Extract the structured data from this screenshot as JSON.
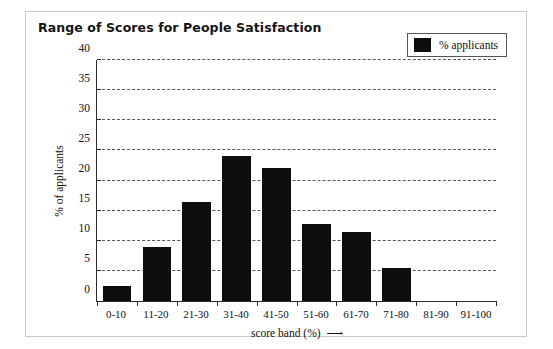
{
  "chart_data": {
    "type": "bar",
    "title": "Range of Scores for People Satisfaction",
    "categories": [
      "0-10",
      "11-20",
      "21-30",
      "31-40",
      "41-50",
      "51-60",
      "61-70",
      "71-80",
      "81-90",
      "91-100"
    ],
    "values": [
      2.5,
      9,
      16.5,
      24,
      22,
      12.8,
      11.5,
      5.5,
      0,
      0
    ],
    "series": [
      {
        "name": "% applicants",
        "values": [
          2.5,
          9,
          16.5,
          24,
          22,
          12.8,
          11.5,
          5.5,
          0,
          0
        ],
        "color": "#0d0d0d"
      }
    ],
    "xlabel": "score band (%)",
    "xlabel_arrow": "⟶",
    "ylabel": "% of applicants",
    "ylim": [
      0,
      40
    ],
    "ytick_values": [
      0,
      5,
      10,
      15,
      20,
      25,
      30,
      35,
      40
    ],
    "ytick_labels": [
      "0",
      "5",
      "10",
      "15",
      "20",
      "25",
      "30",
      "35",
      "40"
    ],
    "grid": "horizontal-dashed",
    "legend": {
      "position": "top-right",
      "entries": [
        {
          "label": "% applicants",
          "color": "#0d0d0d"
        }
      ]
    }
  }
}
